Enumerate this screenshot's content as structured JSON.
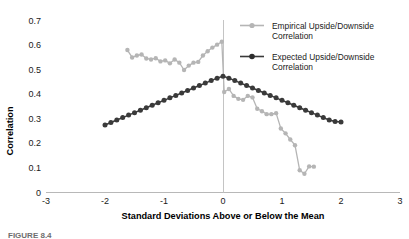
{
  "chart_data": {
    "type": "line",
    "title": "",
    "xlabel": "Standard Deviations Above or Below the Mean",
    "ylabel": "Correlation",
    "xlim": [
      -3,
      3
    ],
    "ylim": [
      0,
      0.7
    ],
    "xticks": [
      "-3",
      "-2",
      "-1",
      "0",
      "1",
      "2",
      "3"
    ],
    "xtick_values": [
      -3,
      -2,
      -1,
      0,
      1,
      2,
      3
    ],
    "yticks": [
      "0",
      "0.1",
      "0.2",
      "0.3",
      "0.4",
      "0.5",
      "0.6",
      "0.7"
    ],
    "ytick_values": [
      0,
      0.1,
      0.2,
      0.3,
      0.4,
      0.5,
      0.6,
      0.7
    ],
    "grid": false,
    "legend_position": "top-right",
    "reference_line_x": 0,
    "series": [
      {
        "name": "Empirical Upside/Downside Correlation",
        "color": "#b5b5b5",
        "marker": "circle",
        "x": [
          -1.62,
          -1.54,
          -1.46,
          -1.38,
          -1.3,
          -1.22,
          -1.14,
          -1.06,
          -0.98,
          -0.9,
          -0.82,
          -0.74,
          -0.66,
          -0.58,
          -0.5,
          -0.42,
          -0.34,
          -0.26,
          -0.18,
          -0.1,
          -0.02,
          0.02,
          0.1,
          0.18,
          0.26,
          0.34,
          0.42,
          0.5,
          0.58,
          0.66,
          0.74,
          0.82,
          0.9,
          0.98,
          1.06,
          1.14,
          1.22,
          1.3,
          1.38,
          1.46,
          1.54
        ],
        "y": [
          0.578,
          0.548,
          0.556,
          0.56,
          0.544,
          0.54,
          0.545,
          0.532,
          0.536,
          0.524,
          0.54,
          0.527,
          0.497,
          0.515,
          0.527,
          0.53,
          0.556,
          0.573,
          0.588,
          0.6,
          0.612,
          0.408,
          0.42,
          0.392,
          0.38,
          0.376,
          0.392,
          0.386,
          0.34,
          0.33,
          0.318,
          0.318,
          0.322,
          0.26,
          0.24,
          0.215,
          0.192,
          0.09,
          0.076,
          0.106,
          0.105
        ]
      },
      {
        "name": "Expected Upside/Downside Correlation",
        "color": "#3a3a3a",
        "marker": "circle",
        "x": [
          -2.0,
          -1.9,
          -1.8,
          -1.7,
          -1.6,
          -1.5,
          -1.4,
          -1.3,
          -1.2,
          -1.1,
          -1.0,
          -0.9,
          -0.8,
          -0.7,
          -0.6,
          -0.5,
          -0.4,
          -0.3,
          -0.2,
          -0.1,
          0.0,
          0.1,
          0.2,
          0.3,
          0.4,
          0.5,
          0.6,
          0.7,
          0.8,
          0.9,
          1.0,
          1.1,
          1.2,
          1.3,
          1.4,
          1.5,
          1.6,
          1.7,
          1.8,
          1.9,
          2.0
        ],
        "y": [
          0.274,
          0.284,
          0.294,
          0.304,
          0.314,
          0.324,
          0.334,
          0.344,
          0.354,
          0.364,
          0.374,
          0.384,
          0.394,
          0.404,
          0.414,
          0.424,
          0.434,
          0.444,
          0.454,
          0.464,
          0.472,
          0.464,
          0.454,
          0.444,
          0.434,
          0.424,
          0.414,
          0.404,
          0.394,
          0.384,
          0.374,
          0.364,
          0.354,
          0.344,
          0.334,
          0.324,
          0.314,
          0.304,
          0.294,
          0.288,
          0.286
        ]
      }
    ]
  },
  "legend": {
    "items": [
      {
        "label_line1": "Empirical Upside/Downside",
        "label_line2": "Correlation",
        "color": "#b5b5b5"
      },
      {
        "label_line1": "Expected Upside/Downside",
        "label_line2": "Correlation",
        "color": "#3a3a3a"
      }
    ]
  },
  "caption": {
    "text": "FIGURE 8.4"
  },
  "colors": {
    "empirical": "#b5b5b5",
    "expected": "#3a3a3a",
    "axis": "#aeaeae",
    "text": "#1a1a1a"
  }
}
